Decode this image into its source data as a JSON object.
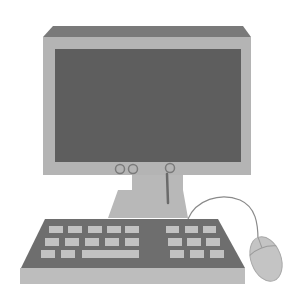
{
  "illustration": {
    "subject": "desktop-computer",
    "description": "Grayscale illustration of a desktop computer with monitor, stand, keyboard and mouse"
  },
  "colors": {
    "background": "#ffffff",
    "monitor_top": "#7a7a7a",
    "monitor_bezel": "#b4b4b4",
    "screen": "#5e5e5e",
    "stand": "#b8b8b8",
    "keyboard_surface": "#6e6e6e",
    "keyboard_front": "#bdbdbd",
    "key": "#c2c2c2",
    "mouse": "#c4c4c4",
    "cable": "#8a8a8a",
    "cord": "#6a6a6a"
  },
  "monitor": {
    "buttons": [
      {
        "name": "monitor-button-1",
        "cx": 120,
        "cy": 169
      },
      {
        "name": "monitor-button-2",
        "cx": 133,
        "cy": 169
      },
      {
        "name": "monitor-button-3",
        "cx": 170,
        "cy": 168
      }
    ]
  },
  "keyboard": {
    "left_block_rows": 3,
    "left_block_cols": 5,
    "right_block_rows": 3,
    "right_block_cols": 3,
    "has_spacebar": true
  }
}
